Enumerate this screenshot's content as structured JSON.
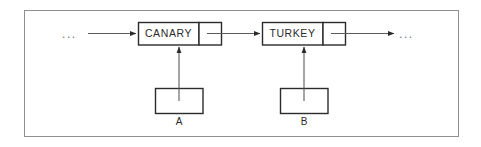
{
  "figure": {
    "background_color": "#ffffff",
    "frame_color": "#8f8f93",
    "stroke_color": "#2b2b2b",
    "text_color": "#2b2b2b",
    "ellipsis_color": "#6d6d70",
    "width": 481,
    "height": 147
  },
  "nodes": [
    {
      "id": "node-canary",
      "data_label": "CANARY",
      "pointer_cell_label": "",
      "x": 138,
      "y": 22,
      "width": 84,
      "height": 23,
      "divider_x": 199
    },
    {
      "id": "node-turkey",
      "data_label": "TURKEY",
      "pointer_cell_label": "",
      "x": 262,
      "y": 22,
      "width": 83,
      "height": 23,
      "divider_x": 323
    }
  ],
  "pointer_variables": [
    {
      "id": "var-a",
      "label": "A",
      "x": 155,
      "y": 88,
      "width": 48,
      "height": 25,
      "target": "node-canary"
    },
    {
      "id": "var-b",
      "label": "B",
      "x": 280,
      "y": 88,
      "width": 48,
      "height": 25,
      "target": "node-turkey"
    }
  ],
  "ellipses": {
    "left": "...",
    "right": "..."
  },
  "arrows": [
    {
      "id": "arrow-incoming",
      "from": "ellipsis-left",
      "to": "node-canary",
      "direction": "right"
    },
    {
      "id": "arrow-canary-to-turkey",
      "from": "node-canary-pointer",
      "to": "node-turkey",
      "direction": "right"
    },
    {
      "id": "arrow-turkey-to-next",
      "from": "node-turkey-pointer",
      "to": "ellipsis-right",
      "direction": "right"
    },
    {
      "id": "arrow-a-to-canary",
      "from": "var-a",
      "to": "node-canary",
      "direction": "up"
    },
    {
      "id": "arrow-b-to-turkey",
      "from": "var-b",
      "to": "node-turkey",
      "direction": "up"
    }
  ]
}
